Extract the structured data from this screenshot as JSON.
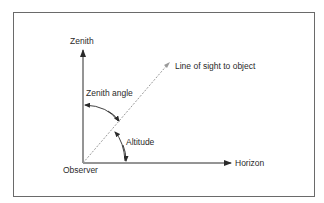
{
  "diagram": {
    "labels": {
      "zenith": "Zenith",
      "line_of_sight": "Line of sight to object",
      "zenith_angle": "Zenith angle",
      "altitude": "Altitude",
      "horizon": "Horizon",
      "observer": "Observer"
    },
    "colors": {
      "axis": "#2a2a2a",
      "line_of_sight": "#9a9a9a",
      "frame": "#6a6a6a"
    }
  }
}
